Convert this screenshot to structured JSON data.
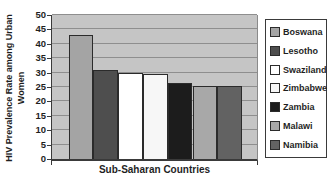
{
  "chart_data": {
    "type": "bar",
    "title": "",
    "xlabel": "Sub-Saharan Countries",
    "ylabel": "HIV Prevalence Rate among Urban Women",
    "ylabel_wrap": [
      "HIV Prevalence Rate among Urban",
      "Women"
    ],
    "categories": [
      "Boswana",
      "Lesotho",
      "Swaziland",
      "Zimbabwe",
      "Zambia",
      "Malawi",
      "Namibia"
    ],
    "values": [
      43,
      31,
      30,
      29.5,
      26.5,
      25.5,
      25.5
    ],
    "colors": [
      "#a4a4a4",
      "#4e4e4e",
      "#ffffff",
      "#f7f7f7",
      "#1c1c1c",
      "#a8a8a8",
      "#626262"
    ],
    "legend": [
      "Boswana",
      "Lesotho",
      "Swaziland",
      "Zimbabwe",
      "Zambia",
      "Malawi",
      "Namibia"
    ],
    "legend_position": "right",
    "ylim": [
      0,
      50
    ],
    "ytick_step": 5,
    "yticks": [
      0,
      5,
      10,
      15,
      20,
      25,
      30,
      35,
      40,
      45,
      50
    ],
    "grid": true,
    "plot_bg_color": "#c5c5c5",
    "gridline_color": "#8e8e8e",
    "axis_color": "#3a3a3a",
    "text_color": "#1f1f1f"
  }
}
